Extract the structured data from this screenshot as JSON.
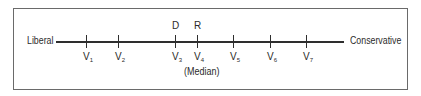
{
  "diagram": {
    "type": "ideological-spectrum",
    "axis": {
      "left_label": "Liberal",
      "right_label": "Conservative"
    },
    "voters": [
      {
        "letter": "V",
        "sub": "1",
        "x": 86
      },
      {
        "letter": "V",
        "sub": "2",
        "x": 118
      },
      {
        "letter": "V",
        "sub": "3",
        "x": 175
      },
      {
        "letter": "V",
        "sub": "4",
        "x": 197
      },
      {
        "letter": "V",
        "sub": "5",
        "x": 233
      },
      {
        "letter": "V",
        "sub": "6",
        "x": 270
      },
      {
        "letter": "V",
        "sub": "7",
        "x": 306
      }
    ],
    "parties": [
      {
        "label": "D",
        "above_voter": "V3"
      },
      {
        "label": "R",
        "above_voter": "V4"
      }
    ],
    "median_note": "(Median)",
    "median_voter": "V4",
    "colors": {
      "line": "#2e2e2e",
      "text": "#2b2b2b",
      "frame": "#6a6a6a"
    }
  }
}
